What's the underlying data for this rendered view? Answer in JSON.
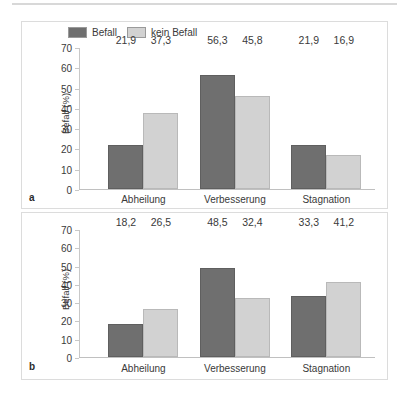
{
  "figure": {
    "legend": {
      "items": [
        {
          "label": "Befall",
          "color": "#6f6f6f",
          "swatch": "dark-gray-swatch"
        },
        {
          "label": "kein Befall",
          "color": "#d2d2d2",
          "swatch": "light-gray-swatch"
        }
      ]
    },
    "panels": [
      {
        "letter": "a"
      },
      {
        "letter": "b"
      }
    ]
  },
  "axis": {
    "ticks": [
      "0",
      "10",
      "20",
      "30",
      "40",
      "50",
      "60",
      "70"
    ],
    "ylabel": "Befall (%)"
  },
  "chart_data": [
    {
      "type": "bar",
      "panel": "a",
      "title": "",
      "xlabel": "",
      "ylabel": "Befall (%)",
      "ylim": [
        0,
        70
      ],
      "ytick_step": 10,
      "grid": false,
      "legend_position": "top-left",
      "categories": [
        "Abheilung",
        "Verbesserung",
        "Stagnation"
      ],
      "series": [
        {
          "name": "Befall",
          "color": "#6f6f6f",
          "values": [
            21.9,
            56.3,
            21.9
          ],
          "labels": [
            "21,9",
            "56,3",
            "21,9"
          ]
        },
        {
          "name": "kein Befall",
          "color": "#d2d2d2",
          "values": [
            37.3,
            45.8,
            16.9
          ],
          "labels": [
            "37,3",
            "45,8",
            "16,9"
          ]
        }
      ]
    },
    {
      "type": "bar",
      "panel": "b",
      "title": "",
      "xlabel": "",
      "ylabel": "Befall (%)",
      "ylim": [
        0,
        70
      ],
      "ytick_step": 10,
      "grid": false,
      "legend_position": "none",
      "categories": [
        "Abheilung",
        "Verbesserung",
        "Stagnation"
      ],
      "series": [
        {
          "name": "Befall",
          "color": "#6f6f6f",
          "values": [
            18.2,
            48.5,
            33.3
          ],
          "labels": [
            "18,2",
            "48,5",
            "33,3"
          ]
        },
        {
          "name": "kein Befall",
          "color": "#d2d2d2",
          "values": [
            26.5,
            32.4,
            41.2
          ],
          "labels": [
            "26,5",
            "32,4",
            "41,2"
          ]
        }
      ]
    }
  ]
}
